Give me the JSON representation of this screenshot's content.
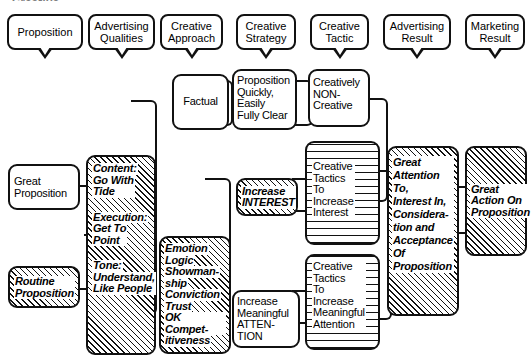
{
  "diagram": {
    "title_fragment": "Creative",
    "headers": [
      {
        "id": "proposition",
        "label": "Proposition"
      },
      {
        "id": "advertising-qualities",
        "label": "Advertising\nQualities"
      },
      {
        "id": "creative-approach",
        "label": "Creative\nApproach"
      },
      {
        "id": "creative-strategy",
        "label": "Creative\nStrategy"
      },
      {
        "id": "creative-tactic",
        "label": "Creative\nTactic"
      },
      {
        "id": "advertising-result",
        "label": "Advertising\nResult"
      },
      {
        "id": "marketing-result",
        "label": "Marketing\nResult"
      }
    ],
    "nodes": {
      "great_proposition": {
        "label": "Great\nProposition",
        "fill": "plain"
      },
      "routine_proposition": {
        "label": "Routine\nProposition",
        "fill": "hatch"
      },
      "qualities": {
        "fill": "hatch",
        "blocks": [
          {
            "heading": "Content:",
            "body": "Go With\nTide"
          },
          {
            "heading": "Execution:",
            "body": "Get To\nPoint"
          },
          {
            "heading": "Tone:",
            "body": "Understand,\nLike People"
          }
        ]
      },
      "attributes": {
        "fill": "hatch",
        "lines": [
          "Emotion",
          "Logic",
          "Showman-",
          "ship",
          "Conviction",
          "Trust",
          "OK Compet-",
          "itiveness"
        ]
      },
      "factual": {
        "label": "Factual",
        "fill": "plain"
      },
      "prop_quickly": {
        "label": "Proposition\nQuickly,\nEasily\nFully Clear",
        "fill": "plain"
      },
      "creatively_non": {
        "label": "Creatively\nNON-\nCreative",
        "fill": "plain"
      },
      "increase_interest": {
        "label": "Increase\nINTEREST",
        "fill": "hatch"
      },
      "increase_meaningful_attention": {
        "label": "Increase\nMeaningful\nATTEN-\nTION",
        "fill": "plain"
      },
      "tactics_interest": {
        "label": "Creative\nTactics\nTo\nIncrease\nInterest",
        "fill": "hlines"
      },
      "tactics_attention": {
        "label": "Creative\nTactics\nTo\nIncrease\nMeaningful\nAttention",
        "fill": "hlines"
      },
      "great_attention": {
        "label": "Great\nAttention\nTo,\nInterest In,\nConsidera-\ntion and\nAcceptance\nOf\nProposition",
        "fill": "hatch"
      },
      "great_action": {
        "label": "Great\nAction On\nProposition",
        "fill": "hatch"
      }
    },
    "colors": {
      "ink": "#111111",
      "paper": "#ffffff",
      "title_gray": "#7c7c7c"
    }
  }
}
